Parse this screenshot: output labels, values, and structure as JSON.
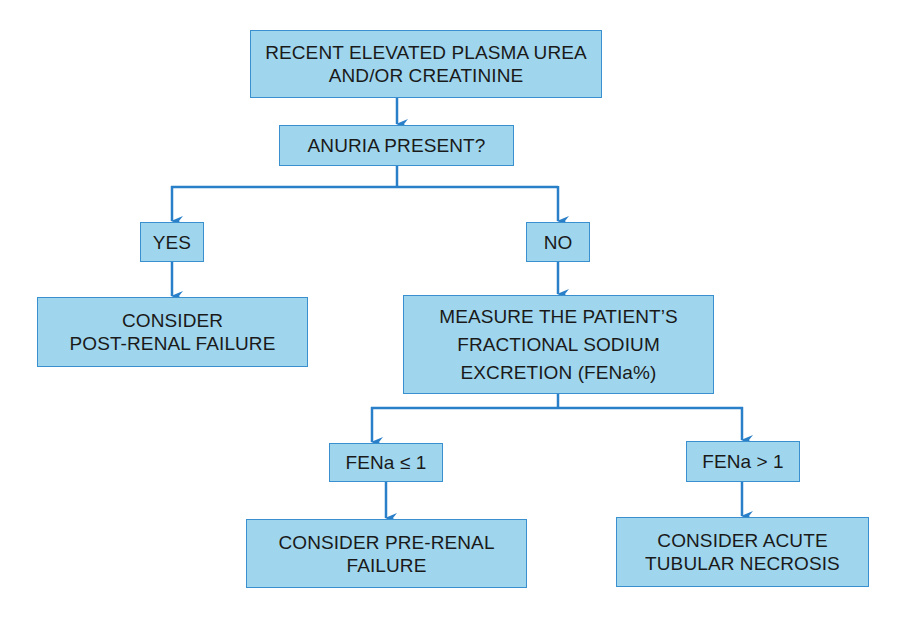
{
  "diagram": {
    "type": "flowchart",
    "line_color": "#2a7fc9",
    "box_fill": "#9fd6ee",
    "box_border": "#3a8fcf",
    "nodes": {
      "start": {
        "lines": [
          "RECENT ELEVATED PLASMA UREA",
          "AND/OR CREATININE"
        ]
      },
      "anuria": {
        "lines": [
          "ANURIA PRESENT?"
        ]
      },
      "yes": {
        "lines": [
          "YES"
        ]
      },
      "no": {
        "lines": [
          "NO"
        ]
      },
      "post_renal": {
        "lines": [
          "CONSIDER",
          "POST-RENAL FAILURE"
        ]
      },
      "measure": {
        "lines": [
          "MEASURE THE PATIENT’S",
          "FRACTIONAL SODIUM",
          "EXCRETION (FENa%)"
        ]
      },
      "fena_low": {
        "lines": [
          "FENa ≤ 1"
        ]
      },
      "fena_high": {
        "lines": [
          "FENa > 1"
        ]
      },
      "pre_renal": {
        "lines": [
          "CONSIDER PRE-RENAL",
          "FAILURE"
        ]
      },
      "atn": {
        "lines": [
          "CONSIDER ACUTE",
          "TUBULAR NECROSIS"
        ]
      }
    },
    "edges": [
      [
        "start",
        "anuria"
      ],
      [
        "anuria",
        "yes"
      ],
      [
        "anuria",
        "no"
      ],
      [
        "yes",
        "post_renal"
      ],
      [
        "no",
        "measure"
      ],
      [
        "measure",
        "fena_low"
      ],
      [
        "measure",
        "fena_high"
      ],
      [
        "fena_low",
        "pre_renal"
      ],
      [
        "fena_high",
        "atn"
      ]
    ]
  }
}
